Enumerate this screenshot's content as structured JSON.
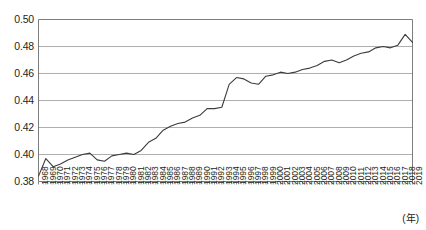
{
  "chart_data": {
    "type": "line",
    "title": "",
    "subtitle": "",
    "xlabel": "(年)",
    "ylabel": "",
    "xlim": [
      1968,
      2019
    ],
    "ylim": [
      0.38,
      0.5
    ],
    "grid": true,
    "grid_axis": "y",
    "legend": false,
    "legend_position": "none",
    "line_color": "#3c3c3c",
    "grid_color": "#a6a6a6",
    "axis_color": "#6e6e6e",
    "background_color": "#ffffff",
    "ytick_labels": [
      "0.50",
      "0.48",
      "0.46",
      "0.44",
      "0.42",
      "0.40",
      "0.38"
    ],
    "ytick_values": [
      0.5,
      0.48,
      0.46,
      0.44,
      0.42,
      0.4,
      0.38
    ],
    "x": [
      1968,
      1969,
      1970,
      1971,
      1972,
      1973,
      1974,
      1975,
      1976,
      1977,
      1978,
      1979,
      1980,
      1981,
      1982,
      1983,
      1984,
      1985,
      1986,
      1987,
      1988,
      1989,
      1990,
      1991,
      1992,
      1993,
      1994,
      1995,
      1996,
      1997,
      1998,
      1999,
      2000,
      2001,
      2002,
      2003,
      2004,
      2005,
      2006,
      2007,
      2008,
      2009,
      2010,
      2011,
      2012,
      2013,
      2014,
      2015,
      2016,
      2017,
      2018,
      2019
    ],
    "categories": [
      "1968",
      "1969",
      "1970",
      "1971",
      "1972",
      "1973",
      "1974",
      "1975",
      "1976",
      "1977",
      "1978",
      "1979",
      "1980",
      "1981",
      "1982",
      "1983",
      "1984",
      "1985",
      "1986",
      "1987",
      "1988",
      "1989",
      "1990",
      "1991",
      "1992",
      "1993",
      "1994",
      "1995",
      "1996",
      "1997",
      "1998",
      "1999",
      "2000",
      "2001",
      "2002",
      "2003",
      "2004",
      "2005",
      "2006",
      "2007",
      "2008",
      "2009",
      "2010",
      "2011",
      "2012",
      "2013",
      "2014",
      "2015",
      "2016",
      "2017",
      "2018",
      "2019"
    ],
    "values": [
      0.384,
      0.397,
      0.391,
      0.393,
      0.396,
      0.398,
      0.4,
      0.401,
      0.396,
      0.395,
      0.399,
      0.4,
      0.401,
      0.4,
      0.403,
      0.409,
      0.412,
      0.418,
      0.421,
      0.423,
      0.424,
      0.427,
      0.429,
      0.434,
      0.434,
      0.435,
      0.452,
      0.457,
      0.456,
      0.453,
      0.452,
      0.458,
      0.459,
      0.461,
      0.46,
      0.461,
      0.463,
      0.464,
      0.466,
      0.469,
      0.47,
      0.468,
      0.47,
      0.473,
      0.475,
      0.476,
      0.479,
      0.48,
      0.479,
      0.481,
      0.489,
      0.483
    ]
  }
}
